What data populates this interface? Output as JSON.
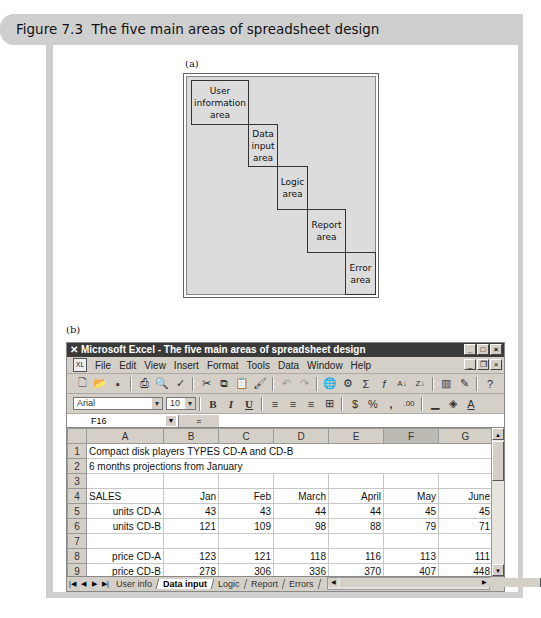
{
  "figure": {
    "number": "Figure 7.3",
    "title": "The five main areas of spreadsheet design"
  },
  "part_a": {
    "label": "(a)",
    "areas": [
      {
        "name": "User information area",
        "lines": [
          "User",
          "information",
          "area"
        ]
      },
      {
        "name": "Data input area",
        "lines": [
          "Data",
          "input",
          "area"
        ]
      },
      {
        "name": "Logic area",
        "lines": [
          "Logic",
          "area"
        ]
      },
      {
        "name": "Report area",
        "lines": [
          "Report",
          "area"
        ]
      },
      {
        "name": "Error area",
        "lines": [
          "Error",
          "area"
        ]
      }
    ]
  },
  "part_b": {
    "label": "(b)",
    "window": {
      "app_icon": "excel-x-icon",
      "title": "Microsoft Excel - The five main areas of spreadsheet design",
      "controls": [
        "minimize",
        "maximize",
        "close"
      ]
    },
    "menu": [
      "File",
      "Edit",
      "View",
      "Insert",
      "Format",
      "Tools",
      "Data",
      "Window",
      "Help"
    ],
    "toolbar_standard": [
      "new",
      "open",
      "save",
      "print",
      "print-preview",
      "spelling",
      "cut",
      "copy",
      "paste",
      "format-painter",
      "undo",
      "redo",
      "hyperlink",
      "web-toolbar",
      "autosum",
      "function",
      "sort-ascending",
      "sort-descending",
      "chart-wizard",
      "drawing",
      "office-assistant"
    ],
    "toolbar_format": {
      "font": "Arial",
      "size": "10",
      "buttons": [
        "bold",
        "italic",
        "underline",
        "align-left",
        "center",
        "align-right",
        "merge-center",
        "currency",
        "percent",
        "comma",
        "increase-decimal",
        "borders",
        "fill-color",
        "font-color"
      ],
      "bold": "B",
      "italic": "I",
      "underline": "U",
      "percent": "%",
      "comma": ","
    },
    "formula_bar": {
      "name_box": "F16",
      "equals": "=",
      "value": ""
    },
    "columns": [
      "A",
      "B",
      "C",
      "D",
      "E",
      "F",
      "G"
    ],
    "selected_column": "F",
    "rows": [
      {
        "n": "1",
        "cells": [
          "Compact disk players TYPES CD-A and CD-B",
          "",
          "",
          "",
          "",
          "",
          ""
        ]
      },
      {
        "n": "2",
        "cells": [
          "6 months projections from January",
          "",
          "",
          "",
          "",
          "",
          ""
        ]
      },
      {
        "n": "3",
        "cells": [
          "",
          "",
          "",
          "",
          "",
          "",
          ""
        ]
      },
      {
        "n": "4",
        "cells": [
          "SALES",
          "Jan",
          "Feb",
          "March",
          "April",
          "May",
          "June"
        ]
      },
      {
        "n": "5",
        "cells": [
          "units CD-A",
          "43",
          "43",
          "44",
          "44",
          "45",
          "45"
        ]
      },
      {
        "n": "6",
        "cells": [
          "units CD-B",
          "121",
          "109",
          "98",
          "88",
          "79",
          "71"
        ]
      },
      {
        "n": "7",
        "cells": [
          "",
          "",
          "",
          "",
          "",
          "",
          ""
        ]
      },
      {
        "n": "8",
        "cells": [
          "price CD-A",
          "123",
          "121",
          "118",
          "116",
          "113",
          "111"
        ]
      },
      {
        "n": "9",
        "cells": [
          "price CD-B",
          "278",
          "306",
          "336",
          "370",
          "407",
          "448"
        ]
      }
    ],
    "sheet_tabs": [
      {
        "label": "User info",
        "active": false
      },
      {
        "label": "Data input",
        "active": true
      },
      {
        "label": "Logic",
        "active": false
      },
      {
        "label": "Report",
        "active": false
      },
      {
        "label": "Errors",
        "active": false
      }
    ]
  }
}
